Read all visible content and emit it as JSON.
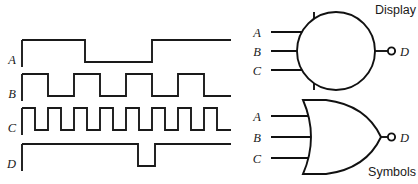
{
  "figure": {
    "title": "",
    "captions": {
      "top_right": "Display",
      "bottom_right": "Symbols"
    }
  },
  "timing_diagram": {
    "signals": [
      {
        "label": "A",
        "name": "waveform-a",
        "baseline_y": 62,
        "high_y": 40,
        "start_x": 22,
        "end_x": 231,
        "transitions": [
          85,
          152
        ]
      },
      {
        "label": "B",
        "name": "waveform-b",
        "baseline_y": 96,
        "high_y": 74,
        "start_x": 22,
        "end_x": 231,
        "transitions": [
          48,
          74,
          100,
          126,
          152,
          178,
          204
        ]
      },
      {
        "label": "C",
        "name": "waveform-c",
        "baseline_y": 130,
        "high_y": 108,
        "start_x": 22,
        "end_x": 231,
        "transitions": [
          35,
          48,
          61,
          74,
          87,
          100,
          113,
          126,
          139,
          152,
          165,
          178,
          191,
          204,
          217
        ]
      },
      {
        "label": "D",
        "name": "waveform-d",
        "baseline_y": 166,
        "high_y": 144,
        "start_x": 22,
        "end_x": 231,
        "transitions": [
          138,
          155
        ]
      }
    ]
  },
  "symbols": {
    "display_gate": {
      "type": "iec-distinctive-shape-circle",
      "inputs": [
        "A",
        "B",
        "C"
      ],
      "output": "D",
      "output_inverted": true,
      "caption": "Display"
    },
    "or_gate": {
      "type": "distinctive-shape-or",
      "inputs": [
        "A",
        "B",
        "C"
      ],
      "output": "D",
      "output_inverted": true,
      "caption": "Symbols"
    }
  },
  "chart_data": {
    "type": "line",
    "xlabel": "time",
    "ylabel": "logic level",
    "grid": false,
    "legend": "none",
    "ylim": [
      0,
      1
    ],
    "series": [
      {
        "name": "A",
        "description": "Slowest square wave: high, then low, then high",
        "levels": [
          1,
          0,
          1
        ],
        "transition_x_px": [
          22,
          85,
          152,
          231
        ]
      },
      {
        "name": "B",
        "description": "Square wave, 4 high pulses, period about 52 px",
        "levels": [
          1,
          0,
          1,
          0,
          1,
          0,
          1,
          0
        ],
        "transition_x_px": [
          22,
          48,
          74,
          100,
          126,
          152,
          178,
          204,
          231
        ]
      },
      {
        "name": "C",
        "description": "Fastest square wave, 8 high pulses, period about 26 px",
        "levels": [
          1,
          0,
          1,
          0,
          1,
          0,
          1,
          0,
          1,
          0,
          1,
          0,
          1,
          0,
          1,
          0
        ],
        "transition_x_px": [
          22,
          35,
          48,
          61,
          74,
          87,
          100,
          113,
          126,
          139,
          152,
          165,
          178,
          191,
          204,
          217,
          231
        ]
      },
      {
        "name": "D",
        "description": "Held high except a single narrow low pulse",
        "levels": [
          1,
          0,
          1
        ],
        "transition_x_px": [
          22,
          138,
          155,
          231
        ]
      }
    ]
  }
}
